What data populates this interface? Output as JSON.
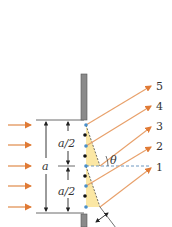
{
  "diagram": {
    "type": "single-slit-diffraction",
    "labels": {
      "slit_width": "a",
      "half_top": "a/2",
      "half_bottom": "a/2",
      "angle": "θ"
    },
    "ray_labels": [
      "1",
      "2",
      "3",
      "4",
      "5"
    ],
    "incident_arrows": 5,
    "colors": {
      "incident_arrow": "#e08a4a",
      "ray": "#e8a06a",
      "wall": "#8a8a8a",
      "wall_edge": "#555555",
      "wavelet_fill": "#fbe49a",
      "blue_dot": "#4a8fc9",
      "black_dot": "#111111",
      "dim_line": "#333333"
    }
  }
}
